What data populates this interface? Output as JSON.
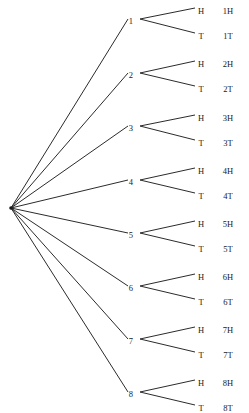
{
  "figure": {
    "name": "probability-tree-diagram",
    "background_color": "#ffffff",
    "line_color": "#2b2b2b",
    "text_color": "#1a1a1a"
  },
  "chart_data": {
    "type": "diagram",
    "title": "",
    "root": {
      "label": "",
      "x": 11,
      "y": 208
    },
    "stage1_label": "die roll",
    "stage2_label": "coin toss",
    "nodes": [
      {
        "label": "1",
        "x": 133,
        "y": 21
      },
      {
        "label": "2",
        "x": 133,
        "y": 75
      },
      {
        "label": "3",
        "x": 133,
        "y": 128
      },
      {
        "label": "4",
        "x": 133,
        "y": 182
      },
      {
        "label": "5",
        "x": 133,
        "y": 235
      },
      {
        "label": "6",
        "x": 133,
        "y": 288
      },
      {
        "label": "7",
        "x": 133,
        "y": 341
      },
      {
        "label": "8",
        "x": 133,
        "y": 394
      }
    ],
    "branches": [
      {
        "label": "H",
        "x": 201,
        "y": 11,
        "outcome": "1H",
        "outcome_x": 228
      },
      {
        "label": "T",
        "x": 201,
        "y": 36,
        "outcome": "1T",
        "outcome_x": 228
      },
      {
        "label": "H",
        "x": 201,
        "y": 64,
        "outcome": "2H",
        "outcome_x": 228
      },
      {
        "label": "T",
        "x": 201,
        "y": 89,
        "outcome": "2T",
        "outcome_x": 228
      },
      {
        "label": "H",
        "x": 201,
        "y": 118,
        "outcome": "3H",
        "outcome_x": 228
      },
      {
        "label": "T",
        "x": 201,
        "y": 143,
        "outcome": "3T",
        "outcome_x": 228
      },
      {
        "label": "H",
        "x": 201,
        "y": 171,
        "outcome": "4H",
        "outcome_x": 228
      },
      {
        "label": "T",
        "x": 201,
        "y": 196,
        "outcome": "4T",
        "outcome_x": 228
      },
      {
        "label": "H",
        "x": 201,
        "y": 224,
        "outcome": "5H",
        "outcome_x": 228
      },
      {
        "label": "T",
        "x": 201,
        "y": 249,
        "outcome": "5T",
        "outcome_x": 228
      },
      {
        "label": "H",
        "x": 201,
        "y": 277,
        "outcome": "6H",
        "outcome_x": 228
      },
      {
        "label": "T",
        "x": 201,
        "y": 302,
        "outcome": "6T",
        "outcome_x": 228
      },
      {
        "label": "H",
        "x": 201,
        "y": 330,
        "outcome": "7H",
        "outcome_x": 228
      },
      {
        "label": "T",
        "x": 201,
        "y": 355,
        "outcome": "7T",
        "outcome_x": 228
      },
      {
        "label": "H",
        "x": 201,
        "y": 383,
        "outcome": "8H",
        "outcome_x": 228
      },
      {
        "label": "T",
        "x": 201,
        "y": 408,
        "outcome": "8T",
        "outcome_x": 228
      }
    ],
    "edges_stage1": [
      {
        "x1": 11,
        "y1": 208,
        "x2": 128,
        "y2": 19
      },
      {
        "x1": 11,
        "y1": 208,
        "x2": 128,
        "y2": 73
      },
      {
        "x1": 11,
        "y1": 208,
        "x2": 128,
        "y2": 126
      },
      {
        "x1": 11,
        "y1": 208,
        "x2": 128,
        "y2": 180
      },
      {
        "x1": 11,
        "y1": 208,
        "x2": 128,
        "y2": 233
      },
      {
        "x1": 11,
        "y1": 208,
        "x2": 128,
        "y2": 286
      },
      {
        "x1": 11,
        "y1": 208,
        "x2": 128,
        "y2": 339
      },
      {
        "x1": 11,
        "y1": 208,
        "x2": 128,
        "y2": 392
      }
    ],
    "edges_stage2": [
      {
        "x1": 140,
        "y1": 19,
        "x2": 195,
        "y2": 8
      },
      {
        "x1": 140,
        "y1": 19,
        "x2": 195,
        "y2": 33
      },
      {
        "x1": 140,
        "y1": 73,
        "x2": 195,
        "y2": 61
      },
      {
        "x1": 140,
        "y1": 73,
        "x2": 195,
        "y2": 86
      },
      {
        "x1": 140,
        "y1": 126,
        "x2": 195,
        "y2": 115
      },
      {
        "x1": 140,
        "y1": 126,
        "x2": 195,
        "y2": 140
      },
      {
        "x1": 140,
        "y1": 180,
        "x2": 195,
        "y2": 168
      },
      {
        "x1": 140,
        "y1": 180,
        "x2": 195,
        "y2": 193
      },
      {
        "x1": 140,
        "y1": 233,
        "x2": 195,
        "y2": 221
      },
      {
        "x1": 140,
        "y1": 233,
        "x2": 195,
        "y2": 246
      },
      {
        "x1": 140,
        "y1": 286,
        "x2": 195,
        "y2": 274
      },
      {
        "x1": 140,
        "y1": 286,
        "x2": 195,
        "y2": 299
      },
      {
        "x1": 140,
        "y1": 339,
        "x2": 195,
        "y2": 327
      },
      {
        "x1": 140,
        "y1": 339,
        "x2": 195,
        "y2": 352
      },
      {
        "x1": 140,
        "y1": 392,
        "x2": 195,
        "y2": 380
      },
      {
        "x1": 140,
        "y1": 392,
        "x2": 195,
        "y2": 405
      }
    ],
    "outcomes": [
      "1H",
      "1T",
      "2H",
      "2T",
      "3H",
      "3T",
      "4H",
      "4T",
      "5H",
      "5T",
      "6H",
      "6T",
      "7H",
      "7T",
      "8H",
      "8T"
    ],
    "first_stage_values": [
      "1",
      "2",
      "3",
      "4",
      "5",
      "6",
      "7",
      "8"
    ],
    "second_stage_values": [
      "H",
      "T"
    ]
  }
}
